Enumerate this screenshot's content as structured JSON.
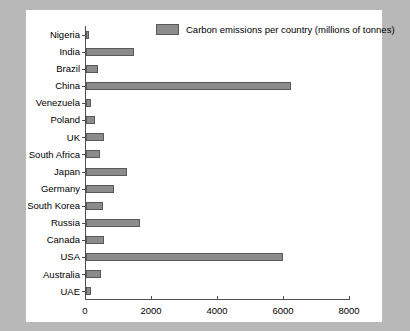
{
  "chart_data": {
    "type": "bar",
    "orientation": "horizontal",
    "title": "",
    "xlabel": "",
    "ylabel": "",
    "xlim": [
      0,
      8000
    ],
    "xticks": [
      0,
      2000,
      4000,
      6000,
      8000
    ],
    "grid": false,
    "legend": {
      "position": "top-right-inside",
      "entries": [
        "Carbon emissions per country (millions of tonnes)"
      ]
    },
    "series_name": "Carbon emissions per country (millions of tonnes)",
    "bar_color": "#8c8c8c",
    "bar_edge_color": "#595959",
    "categories": [
      "Nigeria",
      "India",
      "Brazil",
      "China",
      "Venezuela",
      "Poland",
      "UK",
      "South Africa",
      "Japan",
      "Germany",
      "South Korea",
      "Russia",
      "Canada",
      "USA",
      "Australia",
      "UAE"
    ],
    "values": [
      90,
      1450,
      350,
      6200,
      150,
      280,
      550,
      420,
      1250,
      840,
      500,
      1650,
      550,
      5970,
      450,
      160
    ]
  },
  "figure": {
    "background": "#ffffff",
    "page_background": "#b8b8b8"
  }
}
